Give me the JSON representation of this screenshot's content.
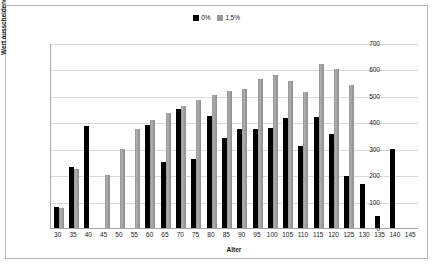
{
  "chart_data": {
    "type": "bar",
    "title": "",
    "xlabel": "Alter",
    "ylabel": "Wert ausscheidender Vorrat (€/ha)",
    "ylim": [
      0,
      700
    ],
    "yticks": [
      0,
      100,
      200,
      300,
      400,
      500,
      600,
      700
    ],
    "grid": true,
    "legend_position": "top-center",
    "categories": [
      30,
      35,
      40,
      45,
      50,
      55,
      60,
      65,
      70,
      75,
      80,
      85,
      90,
      95,
      100,
      105,
      110,
      115,
      120,
      125,
      130,
      135,
      140,
      145
    ],
    "series": [
      {
        "name": "0%",
        "color": "#000000",
        "values": [
          80,
          230,
          385,
          null,
          null,
          null,
          390,
          250,
          450,
          260,
          425,
          340,
          375,
          375,
          380,
          415,
          310,
          420,
          355,
          195,
          165,
          45,
          300,
          null
        ]
      },
      {
        "name": "1,5%",
        "color": "#9a9a9a",
        "values": [
          75,
          225,
          null,
          200,
          300,
          375,
          410,
          435,
          462,
          485,
          505,
          520,
          525,
          562,
          578,
          555,
          515,
          620,
          600,
          540,
          null,
          null,
          null,
          null
        ]
      }
    ]
  },
  "legend": {
    "entries": [
      {
        "label": "0%"
      },
      {
        "label": "1,5%"
      }
    ]
  }
}
